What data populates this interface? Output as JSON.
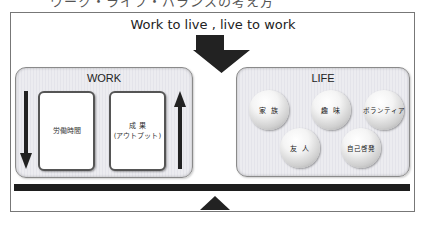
{
  "diagram": {
    "top_cut_text": "ワーク・ライフ・バランスの考え方",
    "headline": "Work to live , live to work",
    "work": {
      "title": "WORK",
      "cards": [
        {
          "lines": [
            "労働時間"
          ]
        },
        {
          "lines": [
            "成 果",
            "(アウトプット)"
          ]
        }
      ],
      "left_arrow": "down",
      "right_arrow": "up"
    },
    "life": {
      "title": "LIFE",
      "items": [
        "家 族",
        "趣 味",
        "ボランティア",
        "友 人",
        "自己啓発"
      ]
    },
    "colors": {
      "frame": "#777777",
      "panel_fill": "#e8e8ee",
      "panel_border": "#8a8a8a",
      "arrow": "#222222",
      "beam": "#1e1e1e"
    }
  }
}
